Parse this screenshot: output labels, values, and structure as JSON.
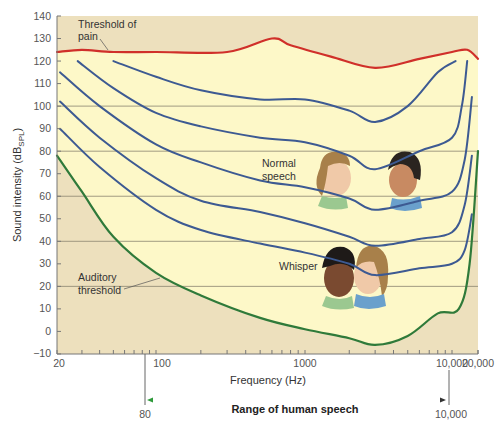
{
  "chart_data": {
    "type": "line",
    "title": "",
    "xlabel": "Frequency (Hz)",
    "ylabel": "Sound intensity (dB_SPL)",
    "ylabel_main": "Sound intensity (dB",
    "ylabel_sub": "SPL",
    "ylabel_close": ")",
    "x_scale": "log",
    "xlim": [
      20,
      20000
    ],
    "ylim": [
      -10,
      140
    ],
    "x_tick_labels": [
      "20",
      "100",
      "1000",
      "10,000",
      "20,000"
    ],
    "x_tick_values": [
      20,
      100,
      1000,
      10000,
      20000
    ],
    "y_ticks": [
      140,
      130,
      120,
      110,
      100,
      90,
      80,
      70,
      60,
      50,
      40,
      30,
      20,
      10,
      0,
      -10
    ],
    "y_tick_labels": [
      "140",
      "130",
      "120",
      "110",
      "100",
      "90",
      "80",
      "70",
      "60",
      "50",
      "40",
      "30",
      "20",
      "10",
      "0",
      "−10"
    ],
    "gridlines_db": [
      100,
      80,
      60,
      40,
      20
    ],
    "grid": true,
    "series": [
      {
        "name": "Threshold of pain",
        "color": "#d0302a",
        "points": [
          [
            20,
            124
          ],
          [
            30,
            125
          ],
          [
            50,
            124
          ],
          [
            100,
            124
          ],
          [
            300,
            124
          ],
          [
            600,
            130
          ],
          [
            800,
            127
          ],
          [
            1500,
            122
          ],
          [
            3000,
            117
          ],
          [
            6000,
            121
          ],
          [
            10000,
            124
          ],
          [
            15000,
            125
          ],
          [
            20000,
            121
          ]
        ]
      },
      {
        "name": "Equal-loudness contour 1",
        "color": "#3d5a92",
        "points": [
          [
            50,
            120
          ],
          [
            100,
            113
          ],
          [
            200,
            107
          ],
          [
            500,
            103
          ],
          [
            1000,
            103
          ],
          [
            2000,
            98
          ],
          [
            3000,
            93
          ],
          [
            5000,
            100
          ],
          [
            8000,
            115
          ],
          [
            11000,
            120
          ]
        ]
      },
      {
        "name": "Equal-loudness contour 2",
        "color": "#3d5a92",
        "points": [
          [
            28,
            120
          ],
          [
            50,
            108
          ],
          [
            100,
            97
          ],
          [
            200,
            91
          ],
          [
            500,
            86
          ],
          [
            1000,
            84
          ],
          [
            2000,
            78
          ],
          [
            3000,
            72
          ],
          [
            6000,
            80
          ],
          [
            10000,
            86
          ],
          [
            13000,
            100
          ],
          [
            15000,
            120
          ]
        ]
      },
      {
        "name": "Equal-loudness contour 3",
        "color": "#3d5a92",
        "points": [
          [
            21,
            115
          ],
          [
            40,
            100
          ],
          [
            100,
            83
          ],
          [
            200,
            75
          ],
          [
            500,
            67
          ],
          [
            1000,
            64
          ],
          [
            2000,
            59
          ],
          [
            3000,
            54
          ],
          [
            6000,
            58
          ],
          [
            10000,
            62
          ],
          [
            14000,
            76
          ],
          [
            17000,
            104
          ]
        ]
      },
      {
        "name": "Equal-loudness contour 4",
        "color": "#3d5a92",
        "points": [
          [
            21,
            102
          ],
          [
            40,
            86
          ],
          [
            100,
            68
          ],
          [
            200,
            58
          ],
          [
            500,
            53
          ],
          [
            1000,
            48
          ],
          [
            2000,
            42
          ],
          [
            3000,
            38
          ],
          [
            6000,
            41
          ],
          [
            10000,
            44
          ],
          [
            14000,
            56
          ],
          [
            17000,
            78
          ]
        ]
      },
      {
        "name": "Equal-loudness contour 5",
        "color": "#3d5a92",
        "points": [
          [
            21,
            90
          ],
          [
            40,
            73
          ],
          [
            100,
            54
          ],
          [
            200,
            45
          ],
          [
            500,
            39
          ],
          [
            1000,
            35
          ],
          [
            2000,
            30
          ],
          [
            3000,
            25
          ],
          [
            6000,
            28
          ],
          [
            10000,
            30
          ],
          [
            14000,
            36
          ],
          [
            17000,
            52
          ]
        ]
      },
      {
        "name": "Auditory threshold",
        "color": "#2f7a3a",
        "points": [
          [
            20,
            78
          ],
          [
            30,
            62
          ],
          [
            50,
            42
          ],
          [
            100,
            26
          ],
          [
            200,
            16
          ],
          [
            500,
            6
          ],
          [
            1000,
            1
          ],
          [
            2000,
            -3
          ],
          [
            3000,
            -6
          ],
          [
            5000,
            -2
          ],
          [
            8000,
            8
          ],
          [
            12000,
            10
          ],
          [
            16000,
            30
          ],
          [
            20000,
            80
          ]
        ]
      }
    ],
    "annotations": [
      {
        "text_lines": [
          "Threshold of",
          "pain"
        ],
        "target": "Threshold of pain"
      },
      {
        "text_lines": [
          "Normal",
          "speech"
        ],
        "region": "60-80 dB, 500-4000 Hz"
      },
      {
        "text_lines": [
          "Whisper"
        ],
        "region": "20-40 dB, 500-4000 Hz"
      },
      {
        "text_lines": [
          "Auditory",
          "threshold"
        ],
        "target": "Auditory threshold"
      }
    ],
    "speech_range": {
      "label": "Range of human speech",
      "from_hz": 80,
      "to_hz": 10000,
      "from_label": "80",
      "to_label": "10,000"
    },
    "colors": {
      "audible_region": "#fdf8c8",
      "outside_region": "#ede0bd",
      "gridline": "#8a8470",
      "axis": "#777777"
    }
  }
}
